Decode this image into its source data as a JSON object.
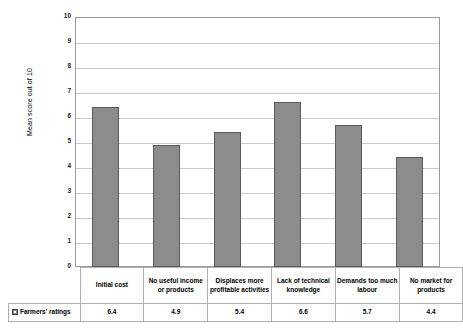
{
  "chart_data": {
    "type": "bar",
    "title": "",
    "xlabel": "",
    "ylabel": "Mean score out of 10",
    "ylim": [
      0,
      10
    ],
    "ytick_labels": [
      "10",
      "9",
      "8",
      "7",
      "6",
      "5",
      "4",
      "3",
      "2",
      "1",
      "0"
    ],
    "grid": true,
    "legend_position": "bottom-table",
    "categories": [
      "Initial cost",
      "No useful income or products",
      "Displaces more profitable activities",
      "Lack of technical knowledge",
      "Demands too much labour",
      "No market for products"
    ],
    "series": [
      {
        "name": "Farmers' ratings",
        "values": [
          6.4,
          4.9,
          5.4,
          6.6,
          5.7,
          4.4
        ],
        "color": "#8C8C8C",
        "border_color": "#5A5A5A"
      }
    ]
  },
  "axis": {
    "y_title": "Mean score out of 10",
    "ticks": [
      "10",
      "9",
      "8",
      "7",
      "6",
      "5",
      "4",
      "3",
      "2",
      "1",
      "0"
    ]
  },
  "table": {
    "legend_label": "Farmers' ratings",
    "headers": [
      "Initial cost",
      "No useful income or products",
      "Displaces more profitable activities",
      "Lack of technical knowledge",
      "Demands too much labour",
      "No market for products"
    ],
    "values": [
      "6.4",
      "4.9",
      "5.4",
      "6.6",
      "5.7",
      "4.4"
    ]
  },
  "colors": {
    "bar_fill": "#8C8C8C",
    "bar_border": "#5A5A5A",
    "gridline": "#C9C9C9",
    "plot_border": "#9A9A9A",
    "table_border": "#B0B0B0"
  }
}
